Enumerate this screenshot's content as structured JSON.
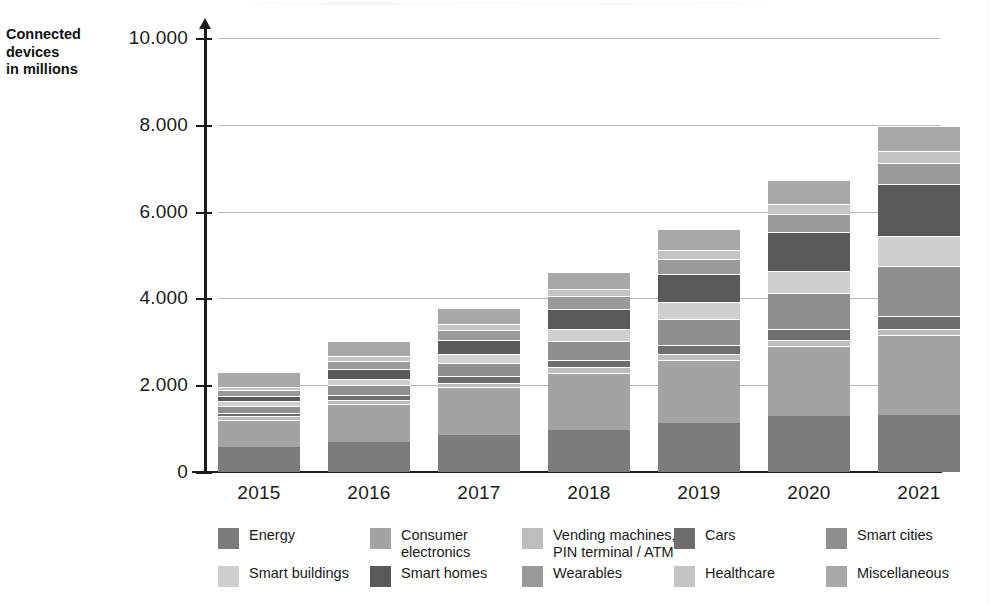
{
  "axis_caption": {
    "line1": "Connected",
    "line2": "devices",
    "line3": "in millions"
  },
  "chart_data": {
    "type": "bar",
    "subtype": "stacked",
    "title": "",
    "xlabel": "",
    "ylabel": "Connected devices in millions",
    "ylim": [
      0,
      10000
    ],
    "grid": true,
    "legend_position": "bottom",
    "ytick_labels": [
      "0",
      "2.000",
      "4.000",
      "6.000",
      "8.000",
      "10.000"
    ],
    "ytick_values": [
      0,
      2000,
      4000,
      6000,
      8000,
      10000
    ],
    "categories": [
      "2015",
      "2016",
      "2017",
      "2018",
      "2019",
      "2020",
      "2021"
    ],
    "totals": [
      2300,
      3030,
      3790,
      4610,
      5610,
      6740,
      7980
    ],
    "series": [
      {
        "name": "Energy",
        "color": "#7c7c7c",
        "values": [
          580,
          700,
          860,
          960,
          1120,
          1280,
          1310
        ]
      },
      {
        "name": "Consumer electronics",
        "color": "#a3a3a3",
        "values": [
          620,
          860,
          1090,
          1330,
          1470,
          1620,
          1840
        ]
      },
      {
        "name": "Vending machines, PIN terminal / ATM",
        "color": "#bdbdbd",
        "values": [
          80,
          95,
          110,
          120,
          130,
          140,
          150
        ]
      },
      {
        "name": "Cars",
        "color": "#6e6e6e",
        "values": [
          90,
          120,
          150,
          180,
          210,
          250,
          290
        ]
      },
      {
        "name": "Smart cities",
        "color": "#8f8f8f",
        "values": [
          150,
          230,
          300,
          420,
          600,
          830,
          1160
        ]
      },
      {
        "name": "Smart buildings",
        "color": "#cfcfcf",
        "values": [
          110,
          150,
          200,
          280,
          390,
          520,
          690
        ]
      },
      {
        "name": "Smart homes",
        "color": "#5a5a5a",
        "values": [
          130,
          230,
          340,
          470,
          650,
          880,
          1200
        ]
      },
      {
        "name": "Wearables",
        "color": "#9a9a9a",
        "values": [
          120,
          180,
          230,
          290,
          350,
          420,
          480
        ]
      },
      {
        "name": "Healthcare",
        "color": "#c4c4c4",
        "values": [
          90,
          115,
          140,
          170,
          200,
          240,
          280
        ]
      },
      {
        "name": "Miscellaneous",
        "color": "#a8a8a8",
        "values": [
          330,
          350,
          370,
          390,
          490,
          560,
          580
        ]
      }
    ]
  },
  "legend": {
    "rows": [
      [
        {
          "label": "Energy",
          "label2": "",
          "color": "#7c7c7c"
        },
        {
          "label": "Consumer",
          "label2": "electronics",
          "color": "#a3a3a3"
        },
        {
          "label": "Vending machines,",
          "label2": "PIN terminal / ATM",
          "color": "#bdbdbd"
        },
        {
          "label": "Cars",
          "label2": "",
          "color": "#6e6e6e"
        },
        {
          "label": "Smart cities",
          "label2": "",
          "color": "#8f8f8f"
        }
      ],
      [
        {
          "label": "Smart buildings",
          "label2": "",
          "color": "#cfcfcf"
        },
        {
          "label": "Smart homes",
          "label2": "",
          "color": "#5a5a5a"
        },
        {
          "label": "Wearables",
          "label2": "",
          "color": "#9a9a9a"
        },
        {
          "label": "Healthcare",
          "label2": "",
          "color": "#c4c4c4"
        },
        {
          "label": "Miscellaneous",
          "label2": "",
          "color": "#a8a8a8"
        }
      ]
    ]
  }
}
